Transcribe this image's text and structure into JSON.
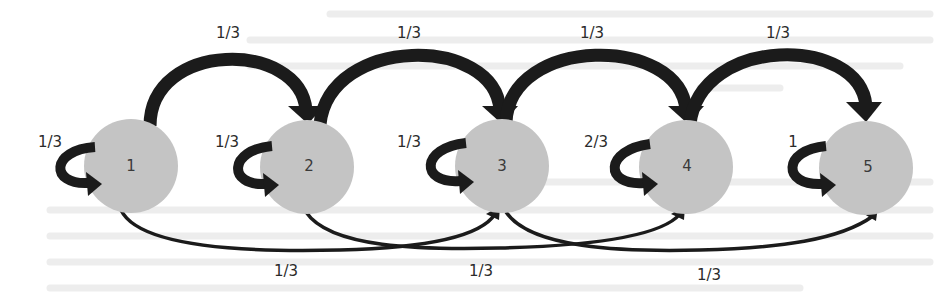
{
  "diagram": {
    "type": "markov-chain-state-diagram",
    "colors": {
      "node_fill": "#c4c4c4",
      "edge": "#1b1b1b",
      "text": "#2b2b2b",
      "background": "#ffffff"
    },
    "nodes": [
      {
        "id": "1",
        "label": "1",
        "cx": 131,
        "cy": 166
      },
      {
        "id": "2",
        "label": "2",
        "cx": 307,
        "cy": 167
      },
      {
        "id": "3",
        "label": "3",
        "cx": 502,
        "cy": 166
      },
      {
        "id": "4",
        "label": "4",
        "cx": 686,
        "cy": 167
      },
      {
        "id": "5",
        "label": "5",
        "cx": 866,
        "cy": 168
      }
    ],
    "self_loops": [
      {
        "node": "1",
        "label": "1/3"
      },
      {
        "node": "2",
        "label": "1/3"
      },
      {
        "node": "3",
        "label": "1/3"
      },
      {
        "node": "4",
        "label": "2/3"
      },
      {
        "node": "5",
        "label": "1"
      }
    ],
    "top_edges": [
      {
        "from": "1",
        "to": "2",
        "label": "1/3"
      },
      {
        "from": "2",
        "to": "3",
        "label": "1/3"
      },
      {
        "from": "3",
        "to": "4",
        "label": "1/3"
      },
      {
        "from": "4",
        "to": "5",
        "label": "1/3"
      }
    ],
    "bottom_edges": [
      {
        "from": "1",
        "to": "3",
        "label": "1/3"
      },
      {
        "from": "2",
        "to": "4",
        "label": "1/3"
      },
      {
        "from": "3",
        "to": "5",
        "label": "1/3"
      }
    ]
  }
}
